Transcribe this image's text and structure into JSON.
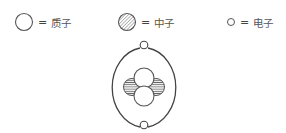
{
  "diagram": {
    "type": "atom-model",
    "legend": [
      {
        "symbol": "proton-circle",
        "equals": "=",
        "label": "质子"
      },
      {
        "symbol": "neutron-hatched-circle",
        "equals": "=",
        "label": "中子"
      },
      {
        "symbol": "electron-small-circle",
        "equals": "=",
        "label": "电子"
      }
    ],
    "nucleus": {
      "protons": 2,
      "neutrons": 2
    },
    "electrons": 2
  }
}
